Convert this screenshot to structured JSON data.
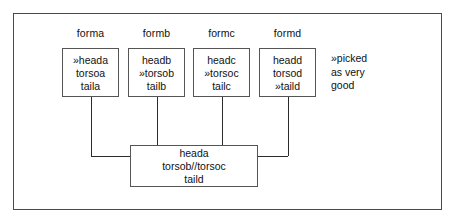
{
  "figure": {
    "type": "flow-diagram",
    "background_color": "#ffffff",
    "frame_color": "#4a4a4a",
    "line_color": "#2b2b2b",
    "text_color": "#111111"
  },
  "columns": [
    {
      "label": "forma",
      "lines": [
        "»heada",
        "torsoa",
        "taila"
      ]
    },
    {
      "label": "formb",
      "lines": [
        "headb",
        "»torsob",
        "tailb"
      ]
    },
    {
      "label": "formc",
      "lines": [
        "headc",
        "»torsoc",
        "tailc"
      ]
    },
    {
      "label": "formd",
      "lines": [
        "headd",
        "torsod",
        "»taild"
      ]
    }
  ],
  "annotation": {
    "lines": [
      "»picked",
      "as very",
      "good"
    ]
  },
  "merged": {
    "lines": [
      "heada",
      "torsob//torsoc",
      "taild"
    ]
  }
}
